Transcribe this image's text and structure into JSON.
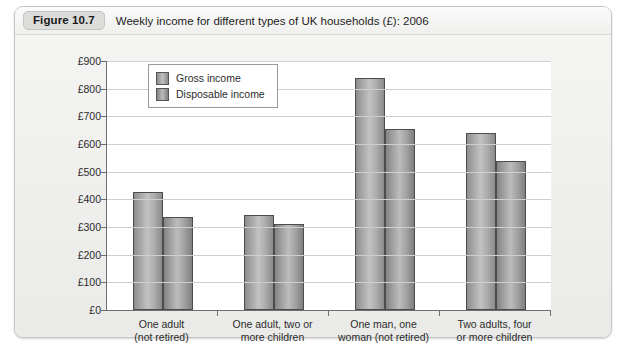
{
  "figure": {
    "badge": "Figure 10.7",
    "title": "Weekly income for different types of UK households (£): 2006"
  },
  "chart_data": {
    "type": "bar",
    "title": "Weekly income for different types of UK households (£): 2006",
    "xlabel": "",
    "ylabel": "",
    "ylim": [
      0,
      900
    ],
    "ytick_labels": [
      "£0",
      "£100",
      "£200",
      "£300",
      "£400",
      "£500",
      "£600",
      "£700",
      "£800",
      "£900"
    ],
    "ytick_values": [
      0,
      100,
      200,
      300,
      400,
      500,
      600,
      700,
      800,
      900
    ],
    "grid": true,
    "legend_position": "top-left inside plot",
    "categories": [
      "One adult\n(not retired)",
      "One adult, two or\nmore children",
      "One man, one\nwoman (not retired)",
      "Two adults, four\nor more children"
    ],
    "category_lines": [
      [
        "One adult",
        "(not retired)"
      ],
      [
        "One adult, two or",
        "more children"
      ],
      [
        "One man, one",
        "woman (not retired)"
      ],
      [
        "Two adults, four",
        "or more children"
      ]
    ],
    "series": [
      {
        "name": "Gross income",
        "values": [
          425,
          345,
          840,
          640
        ]
      },
      {
        "name": "Disposable income",
        "values": [
          335,
          312,
          655,
          537
        ]
      }
    ]
  }
}
